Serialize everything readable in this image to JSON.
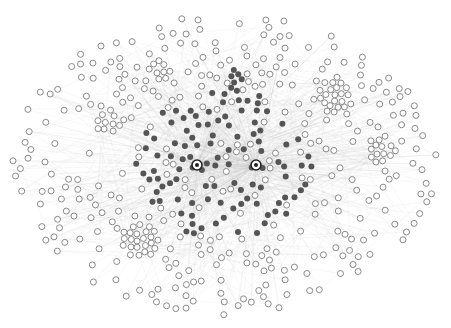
{
  "diagram": {
    "type": "network-graph",
    "canvas": {
      "width": 451,
      "height": 328,
      "background": "#ffffff"
    },
    "colors": {
      "edge": "#c8c8c8",
      "peripheral_node_fill": "#ffffff",
      "peripheral_node_stroke": "#8a8a8a",
      "core_node_fill": "#555555",
      "hub_stroke": "#222222"
    },
    "layout": {
      "center": [
        225,
        165
      ],
      "ellipse_rx": 215,
      "ellipse_ry": 150,
      "core_rx": 90,
      "core_ry": 75
    },
    "hubs": [
      {
        "id": "hub-1",
        "x": 256,
        "y": 165,
        "style": "dark-ring"
      },
      {
        "id": "hub-2",
        "x": 197,
        "y": 165,
        "style": "light-ring"
      }
    ],
    "clusters": [
      {
        "id": "cluster-top-right",
        "x": 335,
        "y": 95,
        "count": 30,
        "radius": 18,
        "kind": "peripheral"
      },
      {
        "id": "cluster-bottom-left",
        "x": 140,
        "y": 240,
        "count": 28,
        "radius": 18,
        "kind": "peripheral"
      },
      {
        "id": "cluster-left",
        "x": 108,
        "y": 122,
        "count": 12,
        "radius": 12,
        "kind": "peripheral"
      },
      {
        "id": "cluster-top-center",
        "x": 238,
        "y": 80,
        "count": 14,
        "radius": 11,
        "kind": "core"
      },
      {
        "id": "cluster-top-left",
        "x": 160,
        "y": 70,
        "count": 10,
        "radius": 10,
        "kind": "peripheral"
      },
      {
        "id": "cluster-right",
        "x": 380,
        "y": 150,
        "count": 12,
        "radius": 12,
        "kind": "peripheral"
      }
    ],
    "counts": {
      "peripheral_scatter": 330,
      "core_scatter": 130,
      "edges": 900
    },
    "node_radius": 3
  }
}
